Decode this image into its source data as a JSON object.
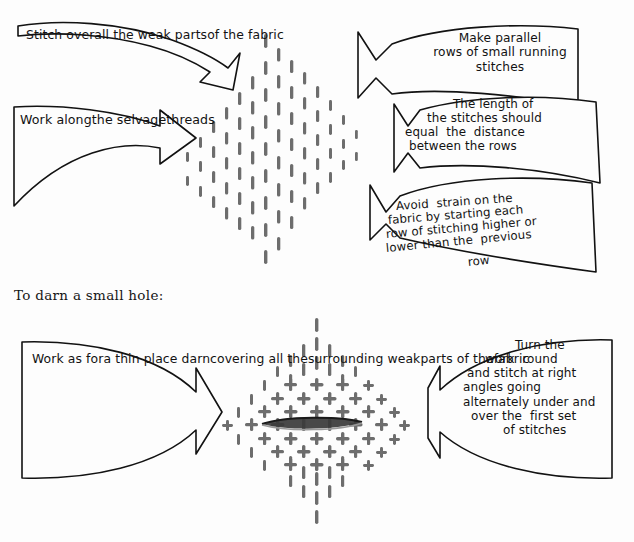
{
  "page": {
    "background_color": "#fdfdfd",
    "ink_color": "#121212",
    "stitch_color": "#6b6b6b"
  },
  "top_section": {
    "callouts": [
      {
        "id": "stitch-over",
        "direction": "right",
        "lines": [
          "Stitch over",
          "all the weak parts",
          "of the fabric"
        ]
      },
      {
        "id": "work-along",
        "direction": "right",
        "lines": [
          "Work along",
          "the selvage",
          "threads"
        ]
      },
      {
        "id": "make-parallel",
        "direction": "left",
        "lines": [
          "Make parallel",
          "rows of small running",
          "stitches"
        ]
      },
      {
        "id": "stitch-length",
        "direction": "left",
        "lines": [
          "The length of",
          "the stitches should",
          "equal  the  distance",
          "between the rows"
        ]
      },
      {
        "id": "avoid-strain",
        "direction": "left",
        "lines": [
          "Avoid  strain on the",
          "fabric by starting each",
          "row of stitching higher or",
          "lower than the  previous",
          "row"
        ]
      }
    ],
    "diagram": {
      "name": "thin-place-darn-diagram",
      "stitch_type": "running-stitches",
      "shape": "diamond"
    }
  },
  "divider": {
    "label": "To darn a small hole:"
  },
  "bottom_section": {
    "callouts": [
      {
        "id": "work-as-for",
        "direction": "right",
        "lines": [
          "Work as for",
          "a thin place darn",
          "covering all the",
          "surrounding weak",
          "parts of the",
          "fabric"
        ]
      },
      {
        "id": "turn-work",
        "direction": "left",
        "lines": [
          "Turn the",
          "work  round",
          "and stitch at right",
          "angles going",
          "alternately under and",
          "over the  first set",
          "of stitches"
        ]
      }
    ],
    "diagram": {
      "name": "small-hole-darn-diagram",
      "stitch_type": "woven-cross-stitches",
      "shape": "diamond",
      "hole": "centre-slit"
    }
  }
}
